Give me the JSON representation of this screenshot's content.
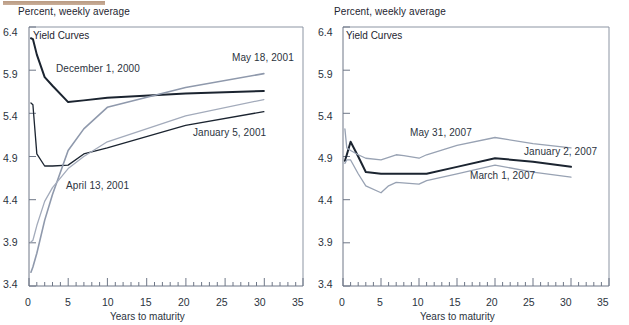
{
  "figure": {
    "top_rule_color": "#b99a82",
    "background": "#ffffff",
    "text_color": "#2b3340"
  },
  "panels": [
    {
      "id": "left",
      "header": "Percent, weekly average",
      "chart_title": "Yield Curves",
      "xlabel": "Years to maturity",
      "ytick_labels": [
        "3.4",
        "3.9",
        "4.4",
        "4.9",
        "5.4",
        "5.9",
        "6.4"
      ],
      "xtick_labels": [
        "0",
        "5",
        "10",
        "15",
        "20",
        "25",
        "30",
        "35"
      ],
      "curve_labels": [
        {
          "text": "December 1, 2000",
          "x": 56,
          "y": 68
        },
        {
          "text": "May 18, 2001",
          "x": 232,
          "y": 58
        },
        {
          "text": "January 5, 2001",
          "x": 193,
          "y": 133
        },
        {
          "text": "April 13, 2001",
          "x": 66,
          "y": 186
        }
      ]
    },
    {
      "id": "right",
      "header": "Percent, weekly average",
      "chart_title": "Yield Curves",
      "xlabel": "Years to maturity",
      "ytick_labels": [
        "3.4",
        "3.9",
        "4.4",
        "4.9",
        "5.4",
        "5.9",
        "6.4"
      ],
      "xtick_labels": [
        "0",
        "5",
        "10",
        "15",
        "20",
        "25",
        "30",
        "35"
      ],
      "curve_labels": [
        {
          "text": "May 31, 2007",
          "x": 410,
          "y": 133
        },
        {
          "text": "January 2, 2007",
          "x": 524,
          "y": 152
        },
        {
          "text": "March 1, 2007",
          "x": 470,
          "y": 176
        }
      ]
    }
  ],
  "chart_data": [
    {
      "type": "line",
      "panel": "left",
      "title": "Yield Curves",
      "subtitle": "Percent, weekly average",
      "xlabel": "Years to maturity",
      "ylabel": "Percent, weekly average",
      "xlim": [
        0,
        35
      ],
      "ylim": [
        3.4,
        6.4
      ],
      "xticks": [
        0,
        5,
        10,
        15,
        20,
        25,
        30,
        35
      ],
      "yticks": [
        3.4,
        3.9,
        4.4,
        4.9,
        5.4,
        5.9,
        6.4
      ],
      "minor_xtick_interval": 1,
      "grid": false,
      "legend": "inline-annotations",
      "series": [
        {
          "name": "December 1, 2000",
          "color": "#1b2430",
          "width": 2.0,
          "x": [
            0.25,
            0.5,
            1,
            2,
            3,
            5,
            7,
            10,
            20,
            30
          ],
          "y": [
            6.27,
            6.26,
            6.08,
            5.82,
            5.72,
            5.53,
            5.55,
            5.58,
            5.63,
            5.66
          ]
        },
        {
          "name": "January 5, 2001",
          "color": "#1b2430",
          "width": 1.3,
          "x": [
            0.25,
            0.5,
            1,
            2,
            3,
            5,
            7,
            10,
            20,
            30
          ],
          "y": [
            5.52,
            5.5,
            4.93,
            4.79,
            4.79,
            4.8,
            4.93,
            5.0,
            5.26,
            5.42
          ]
        },
        {
          "name": "May 18, 2001",
          "color": "#8f99ac",
          "width": 1.6,
          "x": [
            0.25,
            0.5,
            1,
            2,
            3,
            5,
            7,
            10,
            20,
            30
          ],
          "y": [
            3.56,
            3.62,
            3.78,
            4.16,
            4.46,
            4.97,
            5.22,
            5.47,
            5.7,
            5.86
          ]
        },
        {
          "name": "April 13, 2001",
          "color": "#a3abbb",
          "width": 1.3,
          "x": [
            0.25,
            0.5,
            1,
            2,
            3,
            5,
            7,
            10,
            20,
            30
          ],
          "y": [
            3.91,
            3.93,
            4.1,
            4.38,
            4.54,
            4.76,
            4.9,
            5.07,
            5.37,
            5.56
          ]
        }
      ]
    },
    {
      "type": "line",
      "panel": "right",
      "title": "Yield Curves",
      "subtitle": "Percent, weekly average",
      "xlabel": "Years to maturity",
      "ylabel": "Percent, weekly average",
      "xlim": [
        0,
        35
      ],
      "ylim": [
        3.4,
        6.4
      ],
      "xticks": [
        0,
        5,
        10,
        15,
        20,
        25,
        30,
        35
      ],
      "yticks": [
        3.4,
        3.9,
        4.4,
        4.9,
        5.4,
        5.9,
        6.4
      ],
      "minor_xtick_interval": 1,
      "grid": false,
      "legend": "inline-annotations",
      "series": [
        {
          "name": "January 2, 2007",
          "color": "#1b2430",
          "width": 2.0,
          "x": [
            0.25,
            0.5,
            1,
            2,
            3,
            5,
            7,
            10,
            11,
            15,
            20,
            25,
            30
          ],
          "y": [
            4.85,
            4.92,
            5.07,
            4.9,
            4.72,
            4.7,
            4.7,
            4.7,
            4.7,
            4.78,
            4.88,
            4.84,
            4.78
          ]
        },
        {
          "name": "May 31, 2007",
          "color": "#98a2b3",
          "width": 1.3,
          "x": [
            0.25,
            0.5,
            1,
            2,
            3,
            5,
            7,
            8,
            10,
            11,
            15,
            20,
            25,
            30
          ],
          "y": [
            5.22,
            5.0,
            4.97,
            4.92,
            4.88,
            4.86,
            4.92,
            4.91,
            4.88,
            4.92,
            5.03,
            5.12,
            5.05,
            5.0
          ]
        },
        {
          "name": "March 1, 2007",
          "color": "#98a2b3",
          "width": 1.3,
          "x": [
            0.25,
            0.5,
            1,
            2,
            3,
            5,
            6,
            7,
            10,
            11,
            15,
            20,
            25,
            30
          ],
          "y": [
            4.82,
            4.86,
            4.86,
            4.7,
            4.56,
            4.48,
            4.56,
            4.6,
            4.58,
            4.62,
            4.7,
            4.8,
            4.72,
            4.66
          ]
        }
      ]
    }
  ]
}
